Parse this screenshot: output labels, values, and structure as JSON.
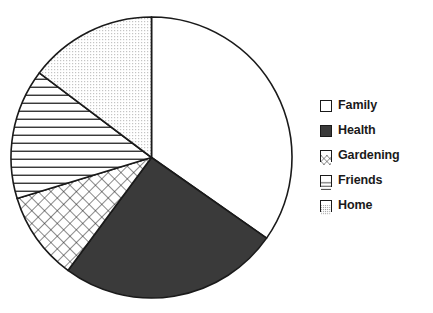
{
  "chart_data": {
    "type": "pie",
    "title": "",
    "subtitle": "",
    "xlabel": "",
    "ylabel": "",
    "grid": false,
    "legend_position": "right",
    "start_angle_deg": 0,
    "direction": "clockwise",
    "categories": [
      "Family",
      "Health",
      "Gardening",
      "Friends",
      "Home"
    ],
    "values": [
      34.7,
      25.4,
      10.1,
      15.0,
      14.8
    ],
    "units": "percent",
    "slices": [
      {
        "label": "Family",
        "value": 34.7,
        "angle_deg": 125.0,
        "start_deg": 0.0,
        "end_deg": 125.0,
        "fill": "solid-white",
        "color": "#ffffff",
        "swatch": "white-square"
      },
      {
        "label": "Health",
        "value": 25.4,
        "angle_deg": 91.5,
        "start_deg": 125.0,
        "end_deg": 216.5,
        "fill": "solid-dark",
        "color": "#3a3a3a",
        "swatch": "dark-square"
      },
      {
        "label": "Gardening",
        "value": 10.1,
        "angle_deg": 36.5,
        "start_deg": 216.5,
        "end_deg": 253.0,
        "fill": "diagonal-crosshatch",
        "color": "#ffffff",
        "swatch": "crosshatch-square"
      },
      {
        "label": "Friends",
        "value": 15.0,
        "angle_deg": 54.0,
        "start_deg": 253.0,
        "end_deg": 307.0,
        "fill": "horizontal-lines",
        "color": "#ffffff",
        "swatch": "horizontal-lines-square"
      },
      {
        "label": "Home",
        "value": 14.8,
        "angle_deg": 53.0,
        "start_deg": 307.0,
        "end_deg": 360.0,
        "fill": "fine-dots",
        "color": "#ffffff",
        "swatch": "dotted-square"
      }
    ],
    "stroke_color": "#1a1a1a",
    "background": "#ffffff"
  },
  "legend": {
    "items": [
      {
        "label": "Family"
      },
      {
        "label": "Health"
      },
      {
        "label": "Gardening"
      },
      {
        "label": "Friends"
      },
      {
        "label": "Home"
      }
    ]
  }
}
